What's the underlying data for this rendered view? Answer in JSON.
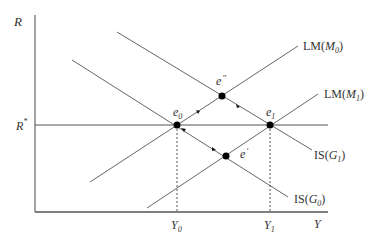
{
  "diagram": {
    "axes": {
      "y_label": "R",
      "x_label": "Y",
      "r_star_label": "R",
      "r_star_sup": "*"
    },
    "x_ticks": [
      {
        "label": "Y",
        "sub": "0"
      },
      {
        "label": "Y",
        "sub": "1"
      }
    ],
    "curves": [
      {
        "id": "lm0",
        "label": "LM(",
        "italic": "M",
        "sub": "0",
        "close": ")"
      },
      {
        "id": "lm1",
        "label": "LM(",
        "italic": "M",
        "sub": "1",
        "close": ")"
      },
      {
        "id": "is1",
        "label": "IS(",
        "italic": "G",
        "sub": "1",
        "close": ")"
      },
      {
        "id": "is0",
        "label": "IS(",
        "italic": "G",
        "sub": "0",
        "close": ")"
      }
    ],
    "points": [
      {
        "id": "e0",
        "label": "e",
        "sub": "0"
      },
      {
        "id": "e1",
        "label": "e",
        "sub": "1"
      },
      {
        "id": "e_double_prime",
        "label": "e",
        "sup": "″"
      },
      {
        "id": "e_prime",
        "label": "e",
        "sup": "′"
      }
    ],
    "colors": {
      "line": "#555555",
      "point": "#000000",
      "text": "#333333"
    }
  }
}
